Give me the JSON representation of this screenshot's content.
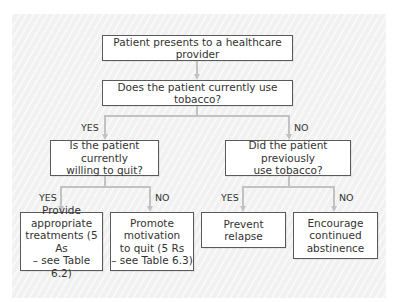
{
  "flowchart": {
    "start": {
      "text": "Patient presents to a healthcare provider"
    },
    "question_1": {
      "text": "Does the patient currently use tobacco?"
    },
    "question_yes": {
      "text": "Is the patient currently\nwilling to quit?"
    },
    "question_no": {
      "text": "Did the patient previously\nuse tobacco?"
    },
    "outcomes": [
      {
        "text": "Provide\nappropriate\ntreatments (5 As\n– see Table 6.2)"
      },
      {
        "text": "Promote\nmotivation\nto quit (5 Rs\n– see Table 6.3)"
      },
      {
        "text": "Prevent\nrelapse"
      },
      {
        "text": "Encourage\ncontinued\nabstinence"
      }
    ],
    "labels": {
      "q1_yes": "YES",
      "q1_no": "NO",
      "qyes_yes": "YES",
      "qyes_no": "NO",
      "qno_yes": "YES",
      "qno_no": "NO"
    }
  },
  "colors": {
    "box_border": "#5a5a5a",
    "connector": "#c2c2c2",
    "text": "#333333",
    "panel": "#f1f1f1"
  }
}
